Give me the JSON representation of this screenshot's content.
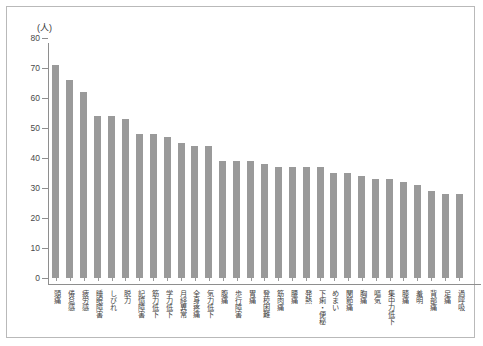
{
  "chart_data": {
    "type": "bar",
    "title": "",
    "subtitle": "",
    "xlabel": "",
    "ylabel": "",
    "unit_label": "(人)",
    "ylim": [
      0,
      80
    ],
    "yticks": [
      0,
      10,
      20,
      30,
      40,
      50,
      60,
      70,
      80
    ],
    "ytick_labels": [
      "0",
      "10",
      "20",
      "30",
      "40",
      "50",
      "60",
      "70",
      "80"
    ],
    "grid": false,
    "legend": null,
    "bar_color": "#9a9a9a",
    "axis_color": "#8e8e8e",
    "frame_color": "#b9b9b9",
    "categories": [
      "頭痛",
      "倦怠感",
      "疲労感",
      "睡眠障害",
      "しびれ",
      "脱力",
      "記憶障害",
      "筋力低下",
      "学力低下",
      "月経異常",
      "全身疼痛",
      "気力低下",
      "腹痛",
      "歩行障害",
      "胃痛",
      "登校困難",
      "筋肉痛",
      "腰痛",
      "発熱",
      "下痢・便秘",
      "めまい",
      "関節痛",
      "胸痛",
      "嘔気",
      "集中力低下",
      "膝痛",
      "羞明",
      "背部痛",
      "足痛",
      "過呼吸"
    ],
    "values": [
      71,
      66,
      62,
      54,
      54,
      53,
      48,
      48,
      47,
      45,
      44,
      44,
      39,
      39,
      39,
      38,
      37,
      37,
      37,
      37,
      35,
      35,
      34,
      33,
      33,
      32,
      31,
      29,
      28,
      28
    ]
  }
}
